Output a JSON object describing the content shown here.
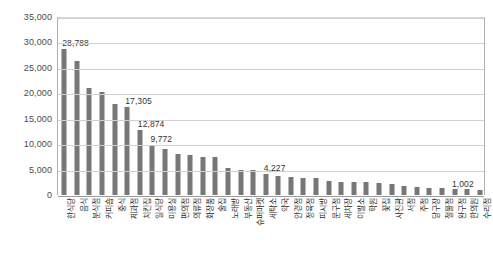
{
  "chart_data": {
    "type": "bar",
    "title": "",
    "xlabel": "",
    "ylabel": "",
    "ylim": [
      0,
      35000
    ],
    "grid": true,
    "legend": "none",
    "y_ticks": [
      0,
      5000,
      10000,
      15000,
      20000,
      25000,
      30000,
      35000
    ],
    "y_tick_labels": [
      "0",
      "5,000",
      "10,000",
      "15,000",
      "20,000",
      "25,000",
      "30,000",
      "35,000"
    ],
    "categories": [
      "한식당",
      "음식",
      "분식점",
      "커피숍",
      "중식",
      "제과점",
      "치킨집",
      "일식당",
      "미용실",
      "편의점",
      "의류점",
      "화장품",
      "술집",
      "노래방",
      "부동산",
      "슈퍼마켓",
      "세탁소",
      "약국",
      "안경점",
      "정육점",
      "피시방",
      "문구점",
      "세차장",
      "이발소",
      "학원",
      "꽃집",
      "사진관",
      "서점",
      "주점",
      "당구장",
      "철물점",
      "완구점",
      "한의원",
      "수리점"
    ],
    "values": [
      28788,
      26400,
      21100,
      20300,
      17800,
      17305,
      12874,
      9772,
      9000,
      8100,
      7900,
      7400,
      7500,
      5400,
      5000,
      4900,
      4227,
      3700,
      3600,
      3400,
      3400,
      2700,
      2600,
      2600,
      2500,
      2400,
      2100,
      1800,
      1500,
      1400,
      1300,
      1200,
      1100,
      1002
    ],
    "annotated_labels": [
      {
        "index": 0,
        "text": "28,788"
      },
      {
        "index": 5,
        "text": "17,305"
      },
      {
        "index": 6,
        "text": "12,874"
      },
      {
        "index": 7,
        "text": "9,772"
      },
      {
        "index": 16,
        "text": "4,227"
      },
      {
        "index": 33,
        "text": "1,002"
      }
    ],
    "colors": {
      "bar": "#777777",
      "grid": "#d0d0d0",
      "axis": "#b0b0b0",
      "text": "#4a4a4a",
      "background": "#ffffff"
    }
  }
}
